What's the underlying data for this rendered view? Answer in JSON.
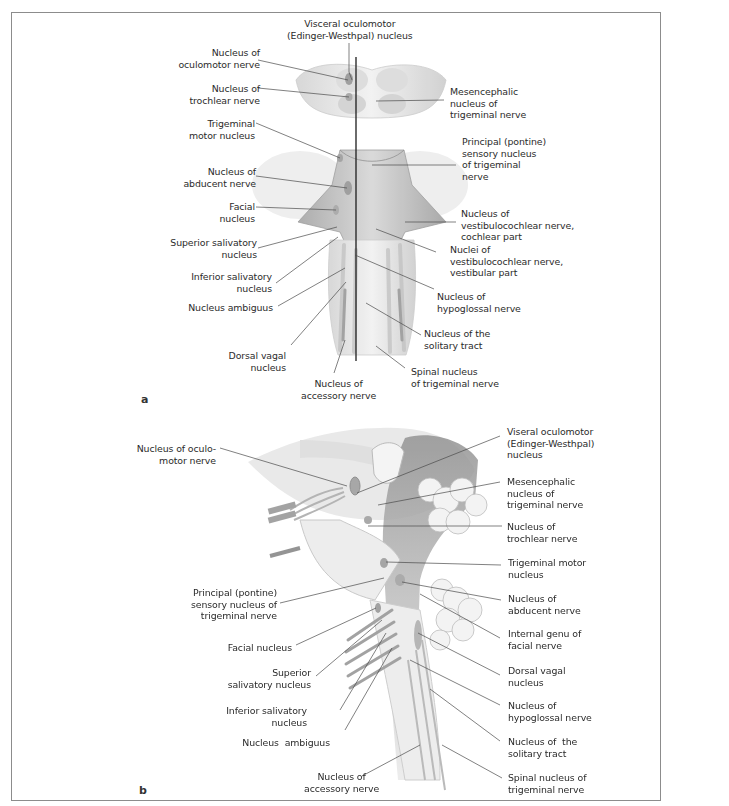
{
  "figure": {
    "panel_a": {
      "letter": "a",
      "view": "dorsal view of brainstem",
      "labels": {
        "top_center": "Visceral oculomotor\n(Edinger-Westhpal) nucleus",
        "left": [
          "Nucleus of\noculomotor nerve",
          "Nucleus of\ntrochlear nerve",
          "Trigeminal\nmotor nucleus",
          "Nucleus of\nabducent nerve",
          "Facial\nnucleus",
          "Superior salivatory\nnucleus",
          "Inferior salivatory\nnucleus",
          "Nucleus ambiguus",
          "Dorsal vagal\nnucleus"
        ],
        "bottom_center": "Nucleus of\naccessory nerve",
        "right": [
          "Mesencephalic\nnucleus of\ntrigeminal nerve",
          "Principal (pontine)\nsensory nucleus\nof trigeminal\nnerve",
          "Nucleus of\nvestibulocochlear nerve,\ncochlear part",
          "Nuclei of\nvestibulocochlear nerve,\nvestibular part",
          "Nucleus of\nhypoglossal nerve",
          "Nucleus of the\nsolitary tract",
          "Spinal nucleus\nof trigeminal nerve"
        ]
      }
    },
    "panel_b": {
      "letter": "b",
      "view": "lateral view of brainstem",
      "labels": {
        "left": [
          "Nucleus of oculo-\nmotor nerve",
          "Principal (pontine)\nsensory nucleus of\ntrigeminal nerve",
          "Facial nucleus",
          "Superior\nsalivatory nucleus",
          "Inferior salivatory\nnucleus",
          "Nucleus  ambiguus"
        ],
        "bottom_center": "Nucleus of\naccessory nerve",
        "right": [
          "Viseral oculomotor\n(Edinger-Westhpal)\nnucleus",
          "Mesencephalic\nnucleus of\ntrigeminal nerve",
          "Nucleus of\ntrochlear nerve",
          "Trigeminal motor\nnucleus",
          "Nucleus of\nabducent nerve",
          "Internal genu of\nfacial nerve",
          "Dorsal vagal\nnucleus",
          "Nucleus of\nhypoglossal nerve",
          "Nucleus of  the\nsolitary tract",
          "Spinal nucleus of\ntrigeminal nerve"
        ]
      }
    },
    "colors": {
      "frame": "#8c8c8c",
      "text": "#2b2b2b",
      "leader": "#4a4a4a",
      "tissue_light": "#e6e6e6",
      "tissue_mid": "#c8c8c8",
      "tissue_dark": "#9a9a9a",
      "midline": "#111111"
    }
  }
}
